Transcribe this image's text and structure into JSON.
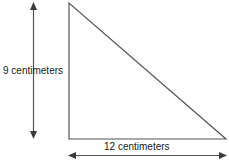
{
  "figure": {
    "type": "right-triangle-dimension-diagram",
    "background_color": "#ffffff",
    "stroke_color": "#555555",
    "text_color": "#1a1a1a",
    "labels": {
      "height": "9 centimeters",
      "base": "12 centimeters"
    },
    "triangle": {
      "apex": [
        69,
        3
      ],
      "bottom_left": [
        69,
        139
      ],
      "bottom_right": [
        226,
        139
      ]
    },
    "height_arrow": {
      "x": 33,
      "top_y": 3,
      "bottom_y": 138,
      "heads": "both"
    },
    "base_arrow": {
      "y": 155,
      "left_x": 69,
      "right_x": 226,
      "heads": "both"
    }
  }
}
